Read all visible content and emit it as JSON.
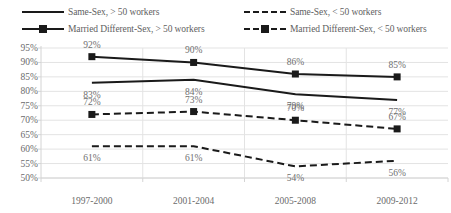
{
  "chart_data": {
    "type": "line",
    "title": "",
    "xlabel": "",
    "ylabel": "",
    "categories": [
      "1997-2000",
      "2001-2004",
      "2005-2008",
      "2009-2012"
    ],
    "ylim": [
      50,
      95
    ],
    "ytick_labels": [
      "95%",
      "90%",
      "85%",
      "80%",
      "75%",
      "70%",
      "65%",
      "60%",
      "55%",
      "50%"
    ],
    "ytick_values": [
      95,
      90,
      85,
      80,
      75,
      70,
      65,
      60,
      55,
      50
    ],
    "grid": true,
    "legend_position": "top",
    "series": [
      {
        "name": "Married Different-Sex, > 50 workers",
        "values": [
          92,
          90,
          86,
          85
        ],
        "data_labels": [
          "92%",
          "90%",
          "86%",
          "85%"
        ],
        "line_style": "solid",
        "marker": "square",
        "color": "#1a1a1a"
      },
      {
        "name": "Same-Sex, > 50 workers",
        "values": [
          83,
          84,
          79,
          77
        ],
        "data_labels": [
          "83%",
          "84%",
          "79%",
          "77%"
        ],
        "line_style": "solid",
        "marker": "none",
        "color": "#1a1a1a"
      },
      {
        "name": "Married Different-Sex, < 50 workers",
        "values": [
          72,
          73,
          70,
          67
        ],
        "data_labels": [
          "72%",
          "73%",
          "70%",
          "67%"
        ],
        "line_style": "dashed",
        "marker": "square",
        "color": "#1a1a1a"
      },
      {
        "name": "Same-Sex, < 50 workers",
        "values": [
          61,
          61,
          54,
          56
        ],
        "data_labels": [
          "61%",
          "61%",
          "54%",
          "56%"
        ],
        "line_style": "dashed",
        "marker": "none",
        "color": "#1a1a1a"
      }
    ]
  },
  "legend": {
    "items": [
      {
        "label": "Same-Sex, > 50 workers",
        "style": "solid",
        "marker": "none",
        "col": 1,
        "row": 1
      },
      {
        "label": "Same-Sex, < 50 workers",
        "style": "dashed",
        "marker": "none",
        "col": 2,
        "row": 1
      },
      {
        "label": "Married Different-Sex, > 50 workers",
        "style": "solid",
        "marker": "square",
        "col": 1,
        "row": 2
      },
      {
        "label": "Married Different-Sex, < 50 workers",
        "style": "dashed",
        "marker": "square",
        "col": 2,
        "row": 2
      }
    ]
  },
  "caption": {
    "text": ""
  },
  "colors": {
    "line": "#1a1a1a",
    "grid": "#e3e3e3",
    "axis": "#d4d4d4",
    "text": "#6b6b6b",
    "background": "#ffffff"
  }
}
